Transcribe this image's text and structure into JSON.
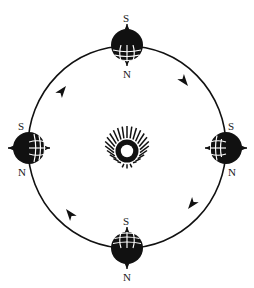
{
  "diagram": {
    "type": "orbit-diagram",
    "background_color": "#ffffff",
    "ink_color": "#111111",
    "center_body": {
      "name": "sun",
      "icon": "sun-icon",
      "cx": 127,
      "cy": 147,
      "core_radius": 7.5,
      "ray_inner_radius": 9,
      "ray_outer_radius": 21,
      "ray_count": 24
    },
    "orbit": {
      "name": "orbit-path",
      "cx": 127,
      "cy": 147,
      "rx": 99,
      "ry": 101,
      "stroke_width": 1.6,
      "direction": "counterclockwise",
      "arrow_count": 4,
      "arrow_angles_deg": [
        128,
        52,
        232,
        308
      ]
    },
    "earth_positions": [
      {
        "id": "earth-top",
        "name": "earth-position-top",
        "cx": 127,
        "cy": 45,
        "radius": 16,
        "axis_orientation": "vertical",
        "grid_side": "bottom",
        "labels": {
          "top": "S",
          "bottom": "N"
        }
      },
      {
        "id": "earth-right",
        "name": "earth-position-right",
        "cx": 226,
        "cy": 148,
        "radius": 16,
        "axis_orientation": "vertical",
        "grid_side": "left",
        "labels": {
          "top_right": "S",
          "bottom_right": "N"
        }
      },
      {
        "id": "earth-bottom",
        "name": "earth-position-bottom",
        "cx": 127,
        "cy": 248,
        "radius": 16,
        "axis_orientation": "vertical",
        "grid_side": "top",
        "labels": {
          "top": "S",
          "bottom": "N"
        }
      },
      {
        "id": "earth-left",
        "name": "earth-position-left",
        "cx": 29,
        "cy": 148,
        "radius": 16,
        "axis_orientation": "vertical",
        "grid_side": "right",
        "labels": {
          "top_left": "S",
          "bottom_left": "N"
        }
      }
    ],
    "labels": {
      "south_pole": "S",
      "north_pole": "N"
    }
  }
}
